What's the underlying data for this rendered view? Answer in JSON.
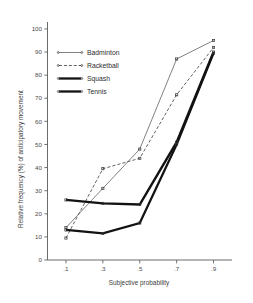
{
  "chart_data": {
    "type": "line",
    "title": "",
    "xlabel": "Subjective probability",
    "ylabel": "Relative frequency (%) of anticipatory movement",
    "x": [
      0.1,
      0.3,
      0.5,
      0.7,
      0.9
    ],
    "categories": [
      ".1",
      ".3",
      ".5",
      ".7",
      ".9"
    ],
    "xtick_labels": [
      ".1",
      ".3",
      ".5",
      ".7",
      ".9"
    ],
    "ytick_labels": [
      "0",
      "10",
      "20",
      "30",
      "40",
      "50",
      "60",
      "70",
      "80",
      "90",
      "100"
    ],
    "ytick_values": [
      0,
      10,
      20,
      30,
      40,
      50,
      60,
      70,
      80,
      90,
      100
    ],
    "ylim": [
      0,
      100
    ],
    "xlim": [
      0.0,
      1.0
    ],
    "grid": false,
    "legend_position": "upper-left-inside",
    "series": [
      {
        "name": "Badminton",
        "style": "thin-solid",
        "color": "#6b6b6b",
        "values": [
          14,
          31,
          48,
          87,
          95
        ]
      },
      {
        "name": "Racketball",
        "style": "dashed",
        "color": "#4f4f4f",
        "values": [
          9.5,
          39.5,
          44,
          71.5,
          92
        ]
      },
      {
        "name": "Squash",
        "style": "thick-solid",
        "color": "#121212",
        "values": [
          26,
          24.5,
          24,
          51,
          90
        ]
      },
      {
        "name": "Tennis",
        "style": "thick-solid",
        "color": "#121212",
        "values": [
          13,
          11.5,
          16,
          50,
          89.5
        ]
      }
    ]
  },
  "legend": {
    "entries": [
      {
        "label": "Badminton"
      },
      {
        "label": "Racketball"
      },
      {
        "label": "Squash"
      },
      {
        "label": "Tennis"
      }
    ]
  },
  "axes": {
    "x_title": "Subjective probability",
    "y_title": "Relative frequency (%) of anticipatory movement"
  }
}
